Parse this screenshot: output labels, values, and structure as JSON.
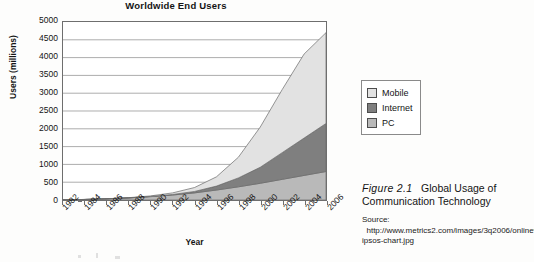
{
  "chart_data": {
    "type": "area",
    "title": "Worldwide End Users",
    "xlabel": "Year",
    "ylabel": "Users (millions)",
    "xlim": [
      1982,
      2006
    ],
    "ylim": [
      0,
      5000
    ],
    "grid": true,
    "stacked": true,
    "legend_position": "right",
    "categories": [
      1982,
      1984,
      1986,
      1988,
      1990,
      1992,
      1994,
      1996,
      1998,
      2000,
      2002,
      2004,
      2006
    ],
    "x": [
      1982,
      1984,
      1986,
      1988,
      1990,
      1992,
      1994,
      1996,
      1998,
      2000,
      2002,
      2004,
      2006
    ],
    "yticks": [
      0,
      500,
      1000,
      1500,
      2000,
      2500,
      3000,
      3500,
      4000,
      4500,
      5000
    ],
    "xticks": [
      "1982",
      "1984",
      "1986",
      "1988",
      "1990",
      "1992",
      "1994",
      "1996",
      "1998",
      "2000",
      "2002",
      "2004",
      "2006"
    ],
    "series": [
      {
        "name": "PC",
        "color": "#b9b9b9",
        "values": [
          5,
          15,
          35,
          60,
          95,
          140,
          200,
          280,
          370,
          470,
          580,
          690,
          800
        ]
      },
      {
        "name": "Internet",
        "color": "#7f7f7f",
        "values": [
          0,
          0,
          0,
          0,
          5,
          15,
          40,
          110,
          250,
          450,
          750,
          1050,
          1350
        ]
      },
      {
        "name": "Mobile",
        "color": "#e2e2e2",
        "values": [
          0,
          0,
          0,
          5,
          15,
          45,
          110,
          260,
          580,
          1130,
          1770,
          2360,
          2550
        ]
      }
    ],
    "cumulative_totals": [
      5,
      15,
      35,
      65,
      115,
      200,
      350,
      650,
      1200,
      2050,
      3100,
      4100,
      4700
    ]
  },
  "legend": {
    "items": [
      {
        "label": "Mobile",
        "color": "#e2e2e2"
      },
      {
        "label": "Internet",
        "color": "#7f7f7f"
      },
      {
        "label": "PC",
        "color": "#b9b9b9"
      }
    ]
  },
  "caption": {
    "figure_number": "Figure 2.1",
    "title": "Global Usage of Communication Technology",
    "source_label": "Source:",
    "source_url": "http://www.metrics2.com/images/3q2006/onlinevideo-ipsos-chart.jpg"
  }
}
